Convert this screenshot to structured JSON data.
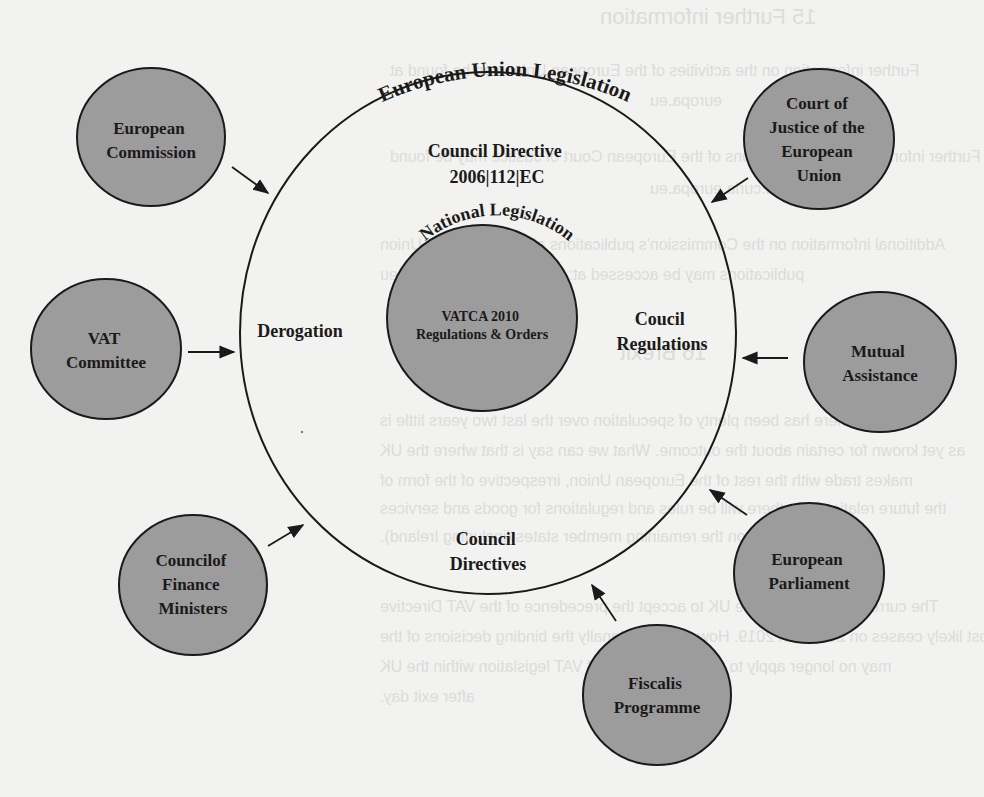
{
  "diagram": {
    "outer_ring_label": "European Union Legislation",
    "inner_ring_label": "National Legislation",
    "regions": {
      "top": [
        "Council Directive",
        "2006|112|EC"
      ],
      "left": "Derogation",
      "right": [
        "Coucil",
        "Regulations"
      ],
      "bottom": [
        "Council",
        "Directives"
      ]
    },
    "core": [
      "VATCA 2010",
      "Regulations & Orders"
    ],
    "nodes": [
      {
        "id": "european-commission",
        "lines": [
          "European",
          "Commission"
        ]
      },
      {
        "id": "court-of-justice",
        "lines": [
          "Court of",
          "Justice of the",
          "European",
          "Union"
        ]
      },
      {
        "id": "vat-committee",
        "lines": [
          "VAT",
          "Committee"
        ]
      },
      {
        "id": "mutual-assistance",
        "lines": [
          "Mutual",
          "Assistance"
        ]
      },
      {
        "id": "council-of-finance-ministers",
        "lines": [
          "Councilof",
          "Finance",
          "Ministers"
        ]
      },
      {
        "id": "european-parliament",
        "lines": [
          "European",
          "Parliament"
        ]
      },
      {
        "id": "fiscalis-programme",
        "lines": [
          "Fiscalis",
          "Programme"
        ]
      }
    ],
    "colors": {
      "node_fill": "#9c9c9c",
      "stroke": "#1a1a1a",
      "background": "#f2f2f0"
    }
  },
  "background_bleed": {
    "heading": "15   Further information",
    "lines": [
      "Further information on the activities of the European Union can be found at",
      "europa.eu",
      "Further information on the decisions of the European Court of Justice may be found",
      "www.curia.europa.eu",
      "Additional information on the Commission's publications about and by the Union",
      "publications may be accessed at: www.bookshop.europa.eu",
      "16   Brexit",
      "Although there has been plenty of speculation over the last two years little is",
      "as yet known for certain about the outcome. What we can say is that where the UK",
      "makes trade with the rest of the European Union, irrespective of the form of",
      "the future relationship, there will be rules and regulations for goods and services",
      "based upon the remaining member states (including Ireland).",
      "The current obligation on the UK to accept the precedence of the VAT Directive",
      "most likely ceases on 29 March 2019. However, additionally the binding decisions of the",
      "may no longer apply to the interpretation of VAT legislation within the UK",
      "after exit day."
    ]
  }
}
